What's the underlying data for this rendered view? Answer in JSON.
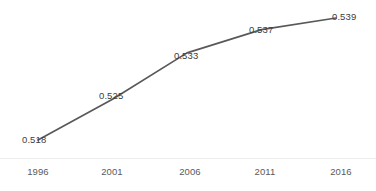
{
  "chart_data": {
    "type": "line",
    "title": "",
    "subtitle": "",
    "xlabel": "",
    "ylabel": "",
    "categories": [
      "1996",
      "2001",
      "2006",
      "2011",
      "2016"
    ],
    "x": [
      1996,
      2001,
      2006,
      2011,
      2016
    ],
    "values": [
      0.518,
      0.525,
      0.533,
      0.537,
      0.539
    ],
    "point_labels": [
      "0.518",
      "0.525",
      "0.533",
      "0.537",
      "0.539"
    ],
    "series": [
      {
        "name": "",
        "values": [
          0.518,
          0.525,
          0.533,
          0.537,
          0.539
        ]
      }
    ],
    "ylim": [
      0.514,
      0.5405
    ],
    "xlim": [
      1994,
      2018
    ],
    "grid": false,
    "legend": false,
    "legend_position": "none",
    "markers": false,
    "data_labels_shown": true,
    "line_color": "#595959",
    "label_color": "#3d3d3d",
    "tick_color": "#5a5a5a",
    "axis_color": "#eceded",
    "background_color": "#ffffff"
  },
  "axis": {
    "x_tick_labels": [
      "1996",
      "2001",
      "2006",
      "2011",
      "2016"
    ]
  },
  "labels": {
    "p1": "0.518",
    "p2": "0.525",
    "p3": "0.533",
    "p4": "0.537",
    "p5": "0.539"
  }
}
